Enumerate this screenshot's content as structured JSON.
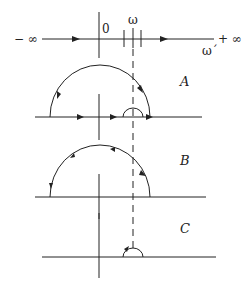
{
  "top_axis": {
    "left_label": "− ∞",
    "right_label": "+ ∞",
    "origin_label": "0",
    "omega_label": "ω",
    "omega_prime_label": "ω´"
  },
  "panels": [
    {
      "label": "A"
    },
    {
      "label": "B"
    },
    {
      "label": "C"
    }
  ],
  "colors": {
    "stroke": "#222222",
    "background": "#ffffff"
  }
}
